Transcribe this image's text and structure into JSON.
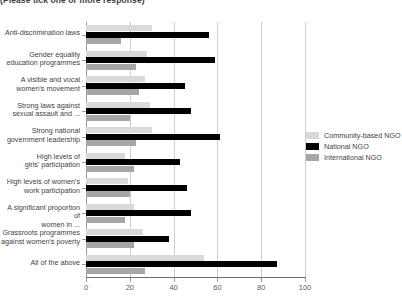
{
  "subtitle": "(Please tick one or more response)",
  "legend": {
    "position": "right",
    "items": [
      {
        "label": "Community-based NGO",
        "color": "#d9d9d9"
      },
      {
        "label": "National NGO",
        "color": "#000000"
      },
      {
        "label": "International NGO",
        "color": "#a6a6a6"
      }
    ]
  },
  "axis": {
    "x_ticks": [
      "0",
      "20",
      "40",
      "60",
      "80",
      "100"
    ],
    "x_min": 0,
    "x_max": 100
  },
  "chart_data": {
    "type": "bar",
    "orientation": "horizontal",
    "title": "(Please tick one or more response)",
    "xlabel": "",
    "ylabel": "",
    "xlim": [
      0,
      100
    ],
    "grid": true,
    "legend_position": "right",
    "categories": [
      "Anti-discrimination laws",
      "Gender equality\neducation programmes",
      "A visible and vocal\nwomen's movement",
      "Strong laws against\nsexual assault and ...",
      "Strong national\ngovernment leadership",
      "High levels of\ngirls' participation",
      "High levels of women's\nwork participation",
      "A significant proportion of\nwomen in ...",
      "Grassroots programmes\nagainst women's poverty",
      "All of the above"
    ],
    "series": [
      {
        "name": "Community-based NGO",
        "color": "#d9d9d9",
        "values": [
          30,
          28,
          27,
          29,
          30,
          18,
          19,
          22,
          26,
          54
        ]
      },
      {
        "name": "National NGO",
        "color": "#000000",
        "values": [
          56,
          59,
          45,
          48,
          61,
          43,
          46,
          48,
          38,
          87
        ]
      },
      {
        "name": "International NGO",
        "color": "#a6a6a6",
        "values": [
          16,
          23,
          24,
          20,
          23,
          22,
          20,
          18,
          22,
          27
        ]
      }
    ]
  }
}
